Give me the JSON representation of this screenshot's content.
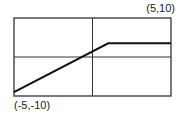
{
  "chart_data": {
    "type": "line",
    "title": "",
    "xlabel": "",
    "ylabel": "",
    "xlim": [
      -5,
      5
    ],
    "ylim": [
      -10,
      10
    ],
    "grid": true,
    "grid_lines": {
      "x": [
        0
      ],
      "y": [
        0
      ]
    },
    "corner_labels": {
      "top_right": "(5,10)",
      "bottom_left": "(-5,-10)"
    },
    "series": [
      {
        "name": "piecewise",
        "x": [
          -5,
          1,
          5
        ],
        "y": [
          -9,
          3.5,
          3.5
        ]
      }
    ],
    "colors": {
      "line": "#111111",
      "frame": "#333333"
    }
  }
}
